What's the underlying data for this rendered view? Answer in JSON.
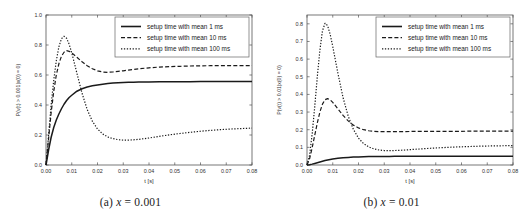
{
  "figure": {
    "panels": [
      {
        "id": "panel-a",
        "caption_tag": "(a)",
        "caption_var": "x",
        "caption_eq": "= 0.001"
      },
      {
        "id": "panel-b",
        "caption_tag": "(b)",
        "caption_var": "x",
        "caption_eq": "= 0.01"
      }
    ]
  },
  "chart_data": [
    {
      "type": "line",
      "title": "",
      "xlabel": "t [s]",
      "ylabel": "P(v(t) > 0.001|x(0) = 0)",
      "xlim": [
        0.0,
        0.08
      ],
      "ylim": [
        0.0,
        1.0
      ],
      "xticks": [
        "0.00",
        "0.01",
        "0.02",
        "0.03",
        "0.04",
        "0.05",
        "0.06",
        "0.07",
        "0.08"
      ],
      "xtick_values": [
        0.0,
        0.01,
        0.02,
        0.03,
        0.04,
        0.05,
        0.06,
        0.07,
        0.08
      ],
      "yticks": [
        "0.0",
        "0.2",
        "0.4",
        "0.6",
        "0.8",
        "1.0"
      ],
      "ytick_values": [
        0.0,
        0.2,
        0.4,
        0.6,
        0.8,
        1.0
      ],
      "grid": false,
      "legend_position": "upper right",
      "x": [
        0.0,
        0.001,
        0.002,
        0.003,
        0.004,
        0.005,
        0.006,
        0.007,
        0.008,
        0.009,
        0.01,
        0.012,
        0.014,
        0.016,
        0.018,
        0.02,
        0.022,
        0.024,
        0.026,
        0.028,
        0.03,
        0.032,
        0.034,
        0.036,
        0.04,
        0.044,
        0.048,
        0.052,
        0.056,
        0.06,
        0.064,
        0.068,
        0.072,
        0.076,
        0.08
      ],
      "series": [
        {
          "name": "setup time with mean 1 ms",
          "style": "solid",
          "values": [
            0.0,
            0.1,
            0.185,
            0.25,
            0.3,
            0.34,
            0.375,
            0.405,
            0.43,
            0.45,
            0.465,
            0.492,
            0.508,
            0.52,
            0.528,
            0.534,
            0.539,
            0.543,
            0.546,
            0.548,
            0.55,
            0.551,
            0.552,
            0.553,
            0.554,
            0.5545,
            0.555,
            0.555,
            0.5555,
            0.556,
            0.556,
            0.556,
            0.5565,
            0.5565,
            0.557
          ]
        },
        {
          "name": "setup time with mean 10 ms",
          "style": "dashed",
          "values": [
            0.0,
            0.175,
            0.35,
            0.49,
            0.6,
            0.675,
            0.725,
            0.752,
            0.762,
            0.758,
            0.748,
            0.718,
            0.688,
            0.662,
            0.642,
            0.628,
            0.62,
            0.618,
            0.62,
            0.624,
            0.628,
            0.633,
            0.637,
            0.641,
            0.648,
            0.653,
            0.656,
            0.658,
            0.66,
            0.661,
            0.662,
            0.662,
            0.663,
            0.663,
            0.663
          ]
        },
        {
          "name": "setup time with mean 100 ms",
          "style": "dotted",
          "values": [
            0.0,
            0.2,
            0.4,
            0.565,
            0.695,
            0.788,
            0.842,
            0.858,
            0.845,
            0.805,
            0.748,
            0.612,
            0.478,
            0.37,
            0.292,
            0.24,
            0.207,
            0.187,
            0.176,
            0.169,
            0.166,
            0.166,
            0.168,
            0.171,
            0.18,
            0.191,
            0.201,
            0.21,
            0.218,
            0.225,
            0.231,
            0.236,
            0.24,
            0.243,
            0.246
          ]
        }
      ]
    },
    {
      "type": "line",
      "title": "",
      "xlabel": "t [s]",
      "ylabel": "P(v(t) > 0.01|x(0) = 0)",
      "xlim": [
        0.0,
        0.08
      ],
      "ylim": [
        0.0,
        0.85
      ],
      "xticks": [
        "0.00",
        "0.01",
        "0.02",
        "0.03",
        "0.04",
        "0.05",
        "0.06",
        "0.07",
        "0.08"
      ],
      "xtick_values": [
        0.0,
        0.01,
        0.02,
        0.03,
        0.04,
        0.05,
        0.06,
        0.07,
        0.08
      ],
      "yticks": [
        "0.0",
        "0.1",
        "0.2",
        "0.3",
        "0.4",
        "0.5",
        "0.6",
        "0.7",
        "0.8"
      ],
      "ytick_values": [
        0.0,
        0.1,
        0.2,
        0.3,
        0.4,
        0.5,
        0.6,
        0.7,
        0.8
      ],
      "grid": false,
      "legend_position": "upper right",
      "x": [
        0.0,
        0.001,
        0.002,
        0.003,
        0.004,
        0.005,
        0.006,
        0.007,
        0.008,
        0.009,
        0.01,
        0.012,
        0.014,
        0.016,
        0.018,
        0.02,
        0.022,
        0.024,
        0.026,
        0.028,
        0.03,
        0.032,
        0.034,
        0.036,
        0.04,
        0.044,
        0.048,
        0.052,
        0.056,
        0.06,
        0.064,
        0.068,
        0.072,
        0.076,
        0.08
      ],
      "series": [
        {
          "name": "setup time with mean 1 ms",
          "style": "solid",
          "values": [
            0.0,
            0.002,
            0.005,
            0.009,
            0.013,
            0.017,
            0.021,
            0.025,
            0.028,
            0.031,
            0.034,
            0.038,
            0.041,
            0.043,
            0.045,
            0.046,
            0.047,
            0.0475,
            0.048,
            0.048,
            0.0485,
            0.0485,
            0.049,
            0.049,
            0.049,
            0.0495,
            0.0495,
            0.0495,
            0.05,
            0.05,
            0.05,
            0.05,
            0.05,
            0.05,
            0.05
          ]
        },
        {
          "name": "setup time with mean 10 ms",
          "style": "dashed",
          "values": [
            0.0,
            0.035,
            0.098,
            0.168,
            0.238,
            0.3,
            0.345,
            0.37,
            0.376,
            0.369,
            0.355,
            0.318,
            0.281,
            0.25,
            0.226,
            0.21,
            0.2,
            0.194,
            0.191,
            0.189,
            0.189,
            0.189,
            0.189,
            0.189,
            0.19,
            0.19,
            0.19,
            0.191,
            0.191,
            0.191,
            0.192,
            0.192,
            0.192,
            0.192,
            0.192
          ]
        },
        {
          "name": "setup time with mean 100 ms",
          "style": "dotted",
          "values": [
            0.0,
            0.055,
            0.175,
            0.33,
            0.5,
            0.65,
            0.76,
            0.803,
            0.79,
            0.74,
            0.672,
            0.52,
            0.382,
            0.277,
            0.202,
            0.152,
            0.121,
            0.102,
            0.091,
            0.085,
            0.082,
            0.081,
            0.082,
            0.083,
            0.087,
            0.091,
            0.095,
            0.098,
            0.101,
            0.103,
            0.105,
            0.107,
            0.108,
            0.109,
            0.11
          ]
        }
      ]
    }
  ],
  "legend": {
    "entries": [
      {
        "label": "setup time with mean 1 ms",
        "style": "solid"
      },
      {
        "label": "setup time with mean 10 ms",
        "style": "dashed"
      },
      {
        "label": "setup time with mean 100 ms",
        "style": "dotted"
      }
    ]
  },
  "colors": {
    "line": "#1a1a1a",
    "axis": "#555555",
    "text": "#303030",
    "background": "#ffffff",
    "legend_border": "#666666"
  }
}
